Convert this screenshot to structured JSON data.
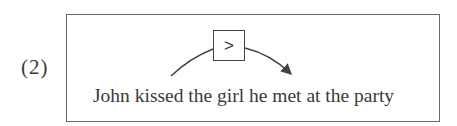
{
  "example": {
    "label": "(2)",
    "sentence": "John kissed the girl he met at the party",
    "relation_symbol": ">"
  },
  "colors": {
    "frame": "#6a6a6a",
    "text": "#3a3a3a",
    "arrow": "#444444"
  }
}
